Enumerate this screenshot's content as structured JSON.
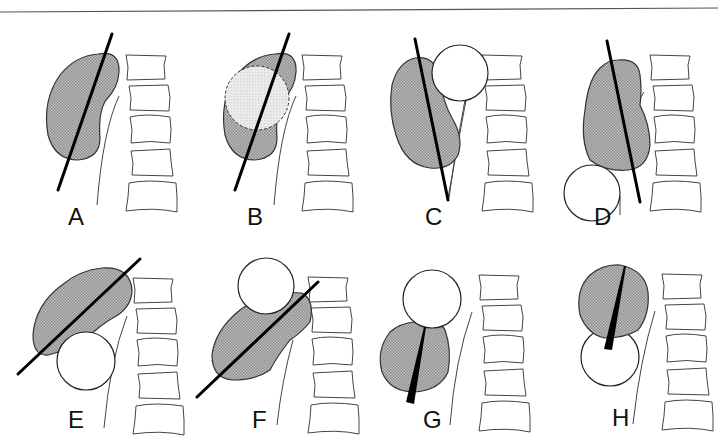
{
  "figure": {
    "top_rule": true,
    "colors": {
      "kidney_fill": "#a9a9a9",
      "line": "#000000",
      "cyst_fill": "#ffffff",
      "highlight_fill": "#e6e6e6"
    },
    "panels": [
      {
        "id": "A",
        "label": "A",
        "desc": "Kidney with long-axis line"
      },
      {
        "id": "B",
        "label": "B",
        "desc": "Kidney with central lighter region (dashed outline) and long-axis line"
      },
      {
        "id": "C",
        "label": "C",
        "desc": "Kidney with upper-pole medial mass, displaced axis"
      },
      {
        "id": "D",
        "label": "D",
        "desc": "Kidney with lower-pole lateral mass, axis line"
      },
      {
        "id": "E",
        "label": "E",
        "desc": "Kidney tilted horizontally by lower mass, axis line"
      },
      {
        "id": "F",
        "label": "F",
        "desc": "Kidney displaced downward by upper mass, axis line"
      },
      {
        "id": "G",
        "label": "G",
        "desc": "Kidney below mass with wedge pointer"
      },
      {
        "id": "H",
        "label": "H",
        "desc": "Kidney above mass with wedge pointer"
      }
    ]
  }
}
